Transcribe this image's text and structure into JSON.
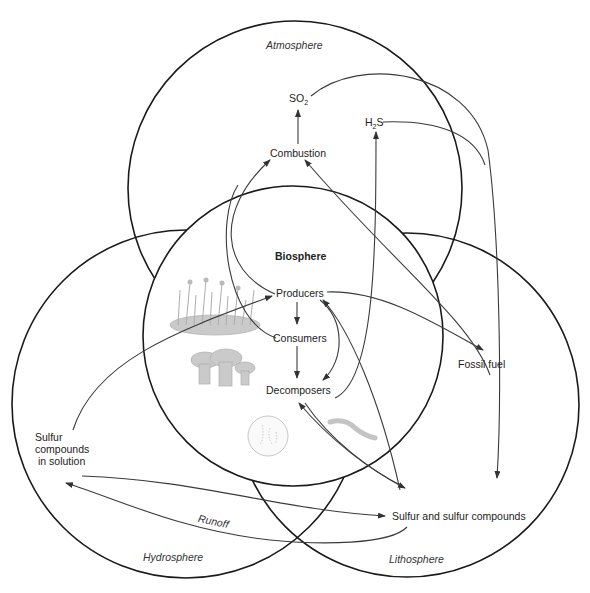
{
  "diagram": {
    "spheres": [
      {
        "id": "atmosphere",
        "label": "Atmosphere"
      },
      {
        "id": "biosphere",
        "label": "Biosphere"
      },
      {
        "id": "hydrosphere",
        "label": "Hydrosphere"
      },
      {
        "id": "lithosphere",
        "label": "Lithosphere"
      }
    ],
    "nodes": {
      "so2": "SO",
      "so2_sub": "2",
      "h2s_h": "H",
      "h2s_sub": "2",
      "h2s_s": "S",
      "combustion": "Combustion",
      "producers": "Producers",
      "consumers": "Consumers",
      "decomposers": "Decomposers",
      "fossil_fuel": "Fossil fuel",
      "sulfur_solution_line1": "Sulfur",
      "sulfur_solution_line2": "compounds",
      "sulfur_solution_line3": "in solution",
      "sulfur_compounds": "Sulfur and sulfur compounds",
      "runoff": "Runoff"
    },
    "edges": [
      {
        "from": "Combustion",
        "to": "SO2"
      },
      {
        "from": "Producers",
        "to": "Combustion"
      },
      {
        "from": "Consumers",
        "to": "Combustion"
      },
      {
        "from": "Fossil fuel",
        "to": "Combustion"
      },
      {
        "from": "Decomposers",
        "to": "H2S"
      },
      {
        "from": "SO2",
        "to": "Sulfur and sulfur compounds"
      },
      {
        "from": "H2S",
        "to": "Sulfur and sulfur compounds"
      },
      {
        "from": "Producers",
        "to": "Consumers"
      },
      {
        "from": "Consumers",
        "to": "Decomposers"
      },
      {
        "from": "Producers",
        "to": "Decomposers"
      },
      {
        "from": "Producers",
        "to": "Fossil fuel"
      },
      {
        "from": "Sulfur and sulfur compounds",
        "to": "Producers"
      },
      {
        "from": "Sulfur and sulfur compounds",
        "to": "Decomposers"
      },
      {
        "from": "Decomposers",
        "to": "Sulfur and sulfur compounds"
      },
      {
        "from": "Sulfur compounds in solution",
        "to": "Producers"
      },
      {
        "from": "Sulfur compounds in solution",
        "to": "Sulfur and sulfur compounds"
      },
      {
        "from": "Sulfur and sulfur compounds",
        "to": "Sulfur compounds in solution",
        "label": "Runoff"
      }
    ]
  }
}
